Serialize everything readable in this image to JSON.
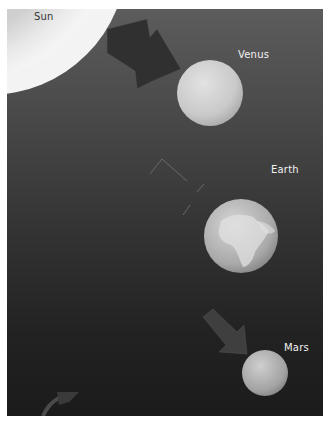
{
  "diagram": {
    "title": "",
    "bodies": [
      {
        "name": "Sun",
        "label": "Sun"
      },
      {
        "name": "Venus",
        "label": "Venus"
      },
      {
        "name": "Earth",
        "label": "Earth"
      },
      {
        "name": "Mars",
        "label": "Mars"
      }
    ],
    "arrows": [
      {
        "from": "Sun",
        "to": "Venus",
        "style": "solid-dark"
      },
      {
        "from": "Venus",
        "to": "Earth",
        "style": "outline-faint"
      },
      {
        "from": "Earth",
        "to": "Mars",
        "style": "solid-muted"
      },
      {
        "from": "off-panel",
        "to": "bottom-left",
        "style": "curved-partial"
      }
    ],
    "colors": {
      "panel_top": "#5c5c5c",
      "panel_bottom": "#1b1b1b",
      "sun": "#e6e6e6",
      "label": "#f2f2f2"
    }
  }
}
